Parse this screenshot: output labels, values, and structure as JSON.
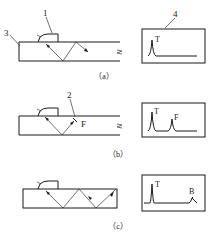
{
  "figure": {
    "panels": [
      {
        "id": "a",
        "caption": "（a）",
        "labels": {
          "probe": "1",
          "plate": "3",
          "screen": "4"
        },
        "screen_peaks": [
          "T"
        ],
        "description": "Angle probe on plate, beam reflects off bottom surface, no defect"
      },
      {
        "id": "b",
        "caption": "（b）",
        "labels": {
          "defect": "2",
          "defect_letter": "F"
        },
        "screen_peaks": [
          "T",
          "F"
        ],
        "description": "Beam hits defect F, echo F appears on screen"
      },
      {
        "id": "c",
        "caption": "（c）",
        "labels": {},
        "screen_peaks": [
          "T",
          "B"
        ],
        "description": "Beam reflects multiple times to plate end, end echo B"
      }
    ]
  }
}
